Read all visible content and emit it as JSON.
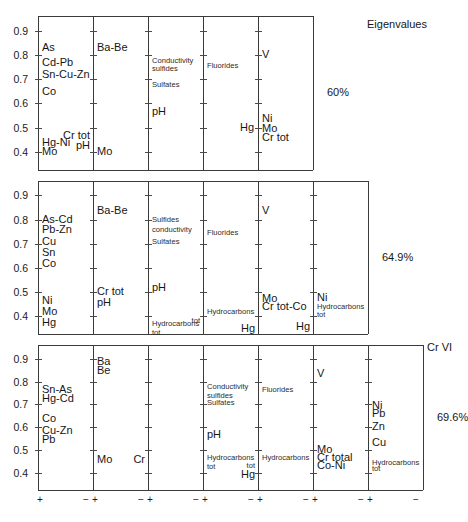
{
  "chart_data": {
    "type": "table",
    "title": "",
    "annotations": {
      "eigenvalues_label": "Eigenvalues",
      "eigenvalues": [
        "60%",
        "64.9%",
        "69.6%"
      ]
    },
    "y_axis": {
      "ticks": [
        "0.9",
        "0.8",
        "0.7",
        "0.6",
        "0.5",
        "0.4"
      ],
      "values": [
        0.9,
        0.8,
        0.7,
        0.6,
        0.5,
        0.4
      ],
      "ylim": [
        0.32,
        0.96
      ]
    },
    "x_axis": {
      "positive_symbol": "+",
      "negative_symbol": "−",
      "note": "each panel spans from + (left) to − (right)"
    },
    "rows": [
      {
        "eigenvalue": "60%",
        "panels": 5,
        "panel_items": [
          [
            {
              "text": "As",
              "value": 0.83,
              "size": "big",
              "align": "left"
            },
            {
              "text": "Cd-Pb",
              "value": 0.765,
              "size": "big",
              "align": "left"
            },
            {
              "text": "Sn-Cu-Zn",
              "value": 0.715,
              "size": "big",
              "align": "left"
            },
            {
              "text": "Co",
              "value": 0.645,
              "size": "big",
              "align": "left"
            },
            {
              "text": "Hg-Ni",
              "value": 0.435,
              "size": "big",
              "align": "left"
            },
            {
              "text": "Mo",
              "value": 0.4,
              "size": "big",
              "align": "left"
            }
          ],
          [
            {
              "text": "Ba-Be",
              "value": 0.83,
              "size": "big",
              "align": "left"
            },
            {
              "text": "Cr tot",
              "value": 0.465,
              "size": "big",
              "align": "right"
            },
            {
              "text": "pH",
              "value": 0.425,
              "size": "big",
              "align": "right"
            },
            {
              "text": "Mo",
              "value": 0.4,
              "size": "big",
              "align": "left"
            }
          ],
          [
            {
              "text": "Conductivity sulfides",
              "value": 0.775,
              "size": "small",
              "align": "left"
            },
            {
              "text": "Sulfates",
              "value": 0.675,
              "size": "small",
              "align": "left"
            },
            {
              "text": "pH",
              "value": 0.565,
              "size": "big",
              "align": "left"
            }
          ],
          [
            {
              "text": "Fluorides",
              "value": 0.755,
              "size": "small",
              "align": "left"
            }
          ],
          [
            {
              "text": "V",
              "value": 0.8,
              "size": "big",
              "align": "left"
            },
            {
              "text": "Hg",
              "value": 0.5,
              "size": "big",
              "align": "rightout"
            },
            {
              "text": "Ni",
              "value": 0.535,
              "size": "big",
              "align": "left"
            },
            {
              "text": "Mo",
              "value": 0.495,
              "size": "big",
              "align": "left"
            },
            {
              "text": "Cr tot",
              "value": 0.455,
              "size": "big",
              "align": "left"
            }
          ]
        ]
      },
      {
        "eigenvalue": "64.9%",
        "panels": 6,
        "panel_items": [
          [
            {
              "text": "As-Cd",
              "value": 0.8,
              "size": "big",
              "align": "left"
            },
            {
              "text": "Pb-Zn",
              "value": 0.755,
              "size": "big",
              "align": "left"
            },
            {
              "text": "Cu",
              "value": 0.705,
              "size": "big",
              "align": "left"
            },
            {
              "text": "Sn",
              "value": 0.66,
              "size": "big",
              "align": "left"
            },
            {
              "text": "Co",
              "value": 0.615,
              "size": "big",
              "align": "left"
            },
            {
              "text": "Ni",
              "value": 0.46,
              "size": "big",
              "align": "left"
            },
            {
              "text": "Mo",
              "value": 0.415,
              "size": "big",
              "align": "left"
            },
            {
              "text": "Hg",
              "value": 0.37,
              "size": "big",
              "align": "left"
            }
          ],
          [
            {
              "text": "Ba-Be",
              "value": 0.835,
              "size": "big",
              "align": "left"
            },
            {
              "text": "Cr tot",
              "value": 0.5,
              "size": "big",
              "align": "left"
            },
            {
              "text": "pH",
              "value": 0.455,
              "size": "big",
              "align": "left"
            }
          ],
          [
            {
              "text": "Sulfides",
              "value": 0.8,
              "size": "small",
              "align": "left"
            },
            {
              "text": "conductivity",
              "value": 0.755,
              "size": "small",
              "align": "left"
            },
            {
              "text": "Sulfates",
              "value": 0.705,
              "size": "small",
              "align": "left"
            },
            {
              "text": "pH",
              "value": 0.515,
              "size": "big",
              "align": "left"
            },
            {
              "text": "Hydrocarbons tot",
              "value": 0.365,
              "size": "small",
              "align": "left"
            }
          ],
          [
            {
              "text": "Fluorides",
              "value": 0.745,
              "size": "small",
              "align": "left"
            },
            {
              "text": "Hydrocarbons",
              "value": 0.415,
              "size": "small",
              "align": "left"
            },
            {
              "text": "tot",
              "value": 0.38,
              "size": "small",
              "align": "right"
            }
          ],
          [
            {
              "text": "V",
              "value": 0.835,
              "size": "big",
              "align": "left"
            },
            {
              "text": "Mo",
              "value": 0.47,
              "size": "big",
              "align": "left"
            },
            {
              "text": "Cr tot-Co",
              "value": 0.435,
              "size": "big",
              "align": "left"
            },
            {
              "text": "Hg",
              "value": 0.345,
              "size": "big",
              "align": "right"
            }
          ],
          [
            {
              "text": "Ni",
              "value": 0.475,
              "size": "big",
              "align": "left"
            },
            {
              "text": "Hydrocarbons",
              "value": 0.435,
              "size": "small",
              "align": "left"
            },
            {
              "text": "tot",
              "value": 0.405,
              "size": "small",
              "align": "left"
            },
            {
              "text": "Hg",
              "value": 0.355,
              "size": "big",
              "align": "right"
            }
          ]
        ]
      },
      {
        "eigenvalue": "69.6%",
        "panels": 7,
        "panel_items": [
          [
            {
              "text": "Sn-As",
              "value": 0.765,
              "size": "big",
              "align": "left"
            },
            {
              "text": "Hg-Cd",
              "value": 0.725,
              "size": "big",
              "align": "left"
            },
            {
              "text": "Co",
              "value": 0.635,
              "size": "big",
              "align": "left"
            },
            {
              "text": "Cu-Zn",
              "value": 0.585,
              "size": "big",
              "align": "left"
            },
            {
              "text": "Pb",
              "value": 0.545,
              "size": "big",
              "align": "left"
            }
          ],
          [
            {
              "text": "Ba",
              "value": 0.885,
              "size": "big",
              "align": "left"
            },
            {
              "text": "Be",
              "value": 0.845,
              "size": "big",
              "align": "left"
            },
            {
              "text": "Mo",
              "value": 0.455,
              "size": "big",
              "align": "left"
            }
          ],
          [
            {
              "text": "Cr",
              "value": 0.455,
              "size": "big",
              "align": "right"
            }
          ],
          [
            {
              "text": "Conductivity sulfides",
              "value": 0.775,
              "size": "small",
              "align": "left"
            },
            {
              "text": "Sulfates",
              "value": 0.705,
              "size": "small",
              "align": "left"
            },
            {
              "text": "pH",
              "value": 0.565,
              "size": "big",
              "align": "left"
            },
            {
              "text": "Hydrocarbons tot",
              "value": 0.465,
              "size": "small",
              "align": "left"
            }
          ],
          [
            {
              "text": "Fluorides",
              "value": 0.765,
              "size": "small",
              "align": "left"
            },
            {
              "text": "Hydrocarbons",
              "value": 0.465,
              "size": "small",
              "align": "left"
            },
            {
              "text": "tot",
              "value": 0.43,
              "size": "small",
              "align": "right"
            },
            {
              "text": "Hg",
              "value": 0.39,
              "size": "big",
              "align": "right"
            }
          ],
          [
            {
              "text": "V",
              "value": 0.835,
              "size": "big",
              "align": "left"
            },
            {
              "text": "Mo",
              "value": 0.5,
              "size": "big",
              "align": "left"
            },
            {
              "text": "Cr total",
              "value": 0.465,
              "size": "big",
              "align": "left"
            },
            {
              "text": "Co-Ni",
              "value": 0.43,
              "size": "big",
              "align": "left"
            }
          ],
          [
            {
              "text": "Ni",
              "value": 0.695,
              "size": "big",
              "align": "left"
            },
            {
              "text": "Pb",
              "value": 0.66,
              "size": "big",
              "align": "left"
            },
            {
              "text": "Zn",
              "value": 0.6,
              "size": "big",
              "align": "left"
            },
            {
              "text": "Cu",
              "value": 0.53,
              "size": "big",
              "align": "left"
            },
            {
              "text": "Hydrocarbons",
              "value": 0.445,
              "size": "small",
              "align": "left"
            },
            {
              "text": "tot",
              "value": 0.415,
              "size": "small",
              "align": "left"
            }
          ],
          [
            {
              "text": "Cr VI",
              "value": 0.945,
              "size": "big",
              "align": "left"
            }
          ]
        ]
      }
    ]
  }
}
